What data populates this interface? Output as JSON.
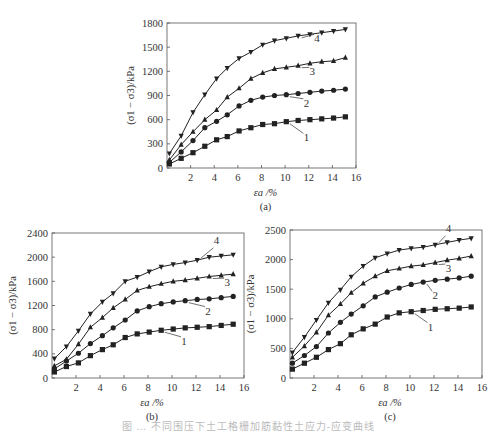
{
  "figure_caption": "图 … 不同围压下土工格栅加筋黏性土应力-应变曲线",
  "chart_data": [
    {
      "panel": "(a)",
      "type": "line",
      "xlabel": "ε_a /%",
      "ylabel": "(σ1 − σ3)/kPa",
      "xlim": [
        0,
        16
      ],
      "ylim": [
        0,
        1800
      ],
      "xticks": [
        2,
        4,
        6,
        8,
        10,
        12,
        14,
        16
      ],
      "yticks": [
        0,
        300,
        600,
        900,
        1200,
        1500,
        1800
      ],
      "grid": false,
      "x": [
        0.2,
        1.2,
        2.2,
        3.2,
        4.2,
        5.1,
        6.1,
        7.1,
        8.1,
        9.1,
        10.1,
        11.1,
        12.1,
        13.1,
        14.1,
        15.1
      ],
      "series": [
        {
          "name": "1",
          "marker": "square",
          "values": [
            50,
            120,
            190,
            270,
            350,
            390,
            460,
            500,
            540,
            550,
            575,
            590,
            600,
            610,
            620,
            635
          ]
        },
        {
          "name": "2",
          "marker": "circle",
          "values": [
            70,
            200,
            340,
            500,
            580,
            660,
            770,
            840,
            880,
            900,
            910,
            925,
            940,
            955,
            965,
            980
          ]
        },
        {
          "name": "3",
          "marker": "triangle-up",
          "values": [
            100,
            290,
            450,
            600,
            720,
            880,
            990,
            1110,
            1180,
            1230,
            1250,
            1270,
            1300,
            1320,
            1330,
            1370
          ]
        },
        {
          "name": "4",
          "marker": "triangle-down",
          "values": [
            180,
            400,
            690,
            910,
            1110,
            1240,
            1360,
            1440,
            1530,
            1580,
            1610,
            1640,
            1660,
            1680,
            1700,
            1720
          ]
        }
      ],
      "labels": [
        {
          "text": "1",
          "x": 11.8,
          "y": 330
        },
        {
          "text": "2",
          "x": 11.8,
          "y": 760
        },
        {
          "text": "3",
          "x": 12.3,
          "y": 1150
        },
        {
          "text": "4",
          "x": 12.7,
          "y": 1560
        }
      ]
    },
    {
      "panel": "(b)",
      "type": "line",
      "xlabel": "ε_a /%",
      "ylabel": "(σ1 − σ3)/kPa",
      "xlim": [
        0,
        16
      ],
      "ylim": [
        0,
        2400
      ],
      "xticks": [
        2,
        4,
        6,
        8,
        10,
        12,
        14,
        16
      ],
      "yticks": [
        0,
        400,
        800,
        1200,
        1600,
        2000,
        2400
      ],
      "grid": false,
      "x": [
        0.2,
        1.2,
        2.2,
        3.2,
        4.2,
        5.1,
        6.1,
        7.1,
        8.1,
        9.1,
        10.1,
        11.1,
        12.1,
        13.1,
        14.1,
        15.1
      ],
      "series": [
        {
          "name": "1",
          "marker": "square",
          "values": [
            100,
            190,
            250,
            370,
            470,
            550,
            670,
            730,
            760,
            790,
            810,
            830,
            840,
            850,
            870,
            890
          ]
        },
        {
          "name": "2",
          "marker": "circle",
          "values": [
            150,
            280,
            410,
            570,
            700,
            830,
            960,
            1110,
            1180,
            1230,
            1260,
            1280,
            1300,
            1310,
            1330,
            1350
          ]
        },
        {
          "name": "3",
          "marker": "triangle-up",
          "values": [
            200,
            310,
            560,
            840,
            1000,
            1160,
            1300,
            1450,
            1510,
            1560,
            1600,
            1620,
            1650,
            1680,
            1700,
            1720
          ]
        },
        {
          "name": "4",
          "marker": "triangle-down",
          "values": [
            320,
            520,
            780,
            1060,
            1260,
            1400,
            1600,
            1670,
            1760,
            1840,
            1880,
            1910,
            1950,
            2000,
            2020,
            2040
          ]
        }
      ],
      "labels": [
        {
          "text": "1",
          "x": 11.0,
          "y": 550
        },
        {
          "text": "2",
          "x": 13.0,
          "y": 1050
        },
        {
          "text": "3",
          "x": 14.6,
          "y": 1520
        },
        {
          "text": "4",
          "x": 13.7,
          "y": 2220
        }
      ]
    },
    {
      "panel": "(c)",
      "type": "line",
      "xlabel": "ε_a /%",
      "ylabel": "(σ1 − σ3)/kPa",
      "xlim": [
        0,
        16
      ],
      "ylim": [
        0,
        2500
      ],
      "xticks": [
        2,
        4,
        6,
        8,
        10,
        12,
        14,
        16
      ],
      "yticks": [
        0,
        500,
        1000,
        1500,
        2000,
        2500
      ],
      "grid": false,
      "x": [
        0.2,
        1.2,
        2.2,
        3.2,
        4.2,
        5.1,
        6.1,
        7.1,
        8.1,
        9.1,
        10.1,
        11.1,
        12.1,
        13.1,
        14.1,
        15.1
      ],
      "series": [
        {
          "name": "1",
          "marker": "square",
          "values": [
            150,
            250,
            350,
            480,
            580,
            730,
            830,
            910,
            1030,
            1100,
            1120,
            1140,
            1160,
            1170,
            1180,
            1200
          ]
        },
        {
          "name": "2",
          "marker": "circle",
          "values": [
            250,
            380,
            530,
            760,
            940,
            1080,
            1220,
            1370,
            1450,
            1520,
            1580,
            1620,
            1650,
            1670,
            1690,
            1720
          ]
        },
        {
          "name": "3",
          "marker": "triangle-up",
          "values": [
            350,
            540,
            770,
            1060,
            1250,
            1440,
            1600,
            1720,
            1810,
            1850,
            1890,
            1910,
            1950,
            1990,
            2020,
            2060
          ]
        },
        {
          "name": "4",
          "marker": "triangle-down",
          "values": [
            430,
            690,
            980,
            1270,
            1490,
            1710,
            1890,
            2030,
            2100,
            2160,
            2190,
            2210,
            2250,
            2290,
            2330,
            2360
          ]
        }
      ],
      "labels": [
        {
          "text": "1",
          "x": 11.7,
          "y": 800
        },
        {
          "text": "2",
          "x": 12.1,
          "y": 1330
        },
        {
          "text": "3",
          "x": 13.2,
          "y": 1790
        },
        {
          "text": "4",
          "x": 13.2,
          "y": 2470
        }
      ]
    }
  ],
  "panels_layout": [
    {
      "left": 167,
      "top": 23,
      "right": 356,
      "bottom": 168
    },
    {
      "left": 52,
      "top": 233,
      "right": 244,
      "bottom": 378
    },
    {
      "left": 290,
      "top": 230,
      "right": 482,
      "bottom": 378
    }
  ]
}
